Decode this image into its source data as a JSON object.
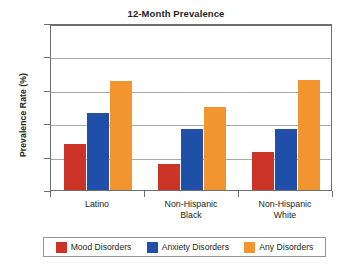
{
  "chart_data": {
    "type": "bar",
    "title": "12-Month Prevalence",
    "xlabel": "",
    "ylabel": "Prevalence Rate (%)",
    "ylim": [
      0,
      52
    ],
    "yticks": [
      0,
      10,
      20,
      30,
      40,
      52
    ],
    "ytick_labels": [
      "0",
      "10",
      "20",
      "30",
      "40",
      "52"
    ],
    "grid": true,
    "legend_position": "bottom",
    "categories": [
      "Latino",
      "Non-Hispanic Black",
      "Non-Hispanic White"
    ],
    "category_lines": [
      [
        "Latino"
      ],
      [
        "Non-Hispanic",
        "Black"
      ],
      [
        "Non-Hispanic",
        "White"
      ]
    ],
    "series": [
      {
        "name": "Mood Disorders",
        "color": "#cc3327",
        "values": [
          13.8,
          7.8,
          11.3
        ]
      },
      {
        "name": "Anxiety Disorders",
        "color": "#1f4fa8",
        "values": [
          23.0,
          18.2,
          18.2
        ]
      },
      {
        "name": "Any Disorders",
        "color": "#f2952e",
        "values": [
          32.5,
          24.8,
          33.0
        ]
      }
    ]
  },
  "legend": {
    "items": [
      {
        "label": "Mood Disorders",
        "color": "#cc3327"
      },
      {
        "label": "Anxiety Disorders",
        "color": "#1f4fa8"
      },
      {
        "label": "Any Disorders",
        "color": "#f2952e"
      }
    ]
  }
}
